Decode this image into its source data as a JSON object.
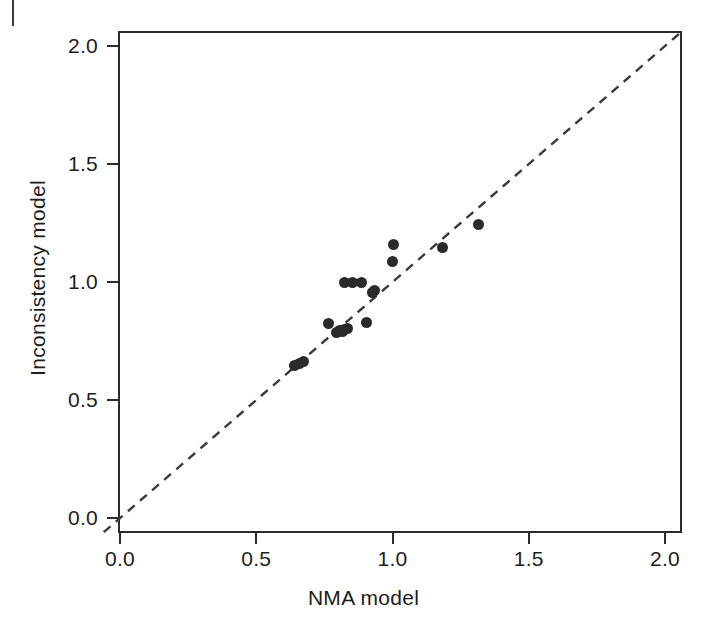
{
  "figure": {
    "background": "#ffffff",
    "marker_color": "#2a2a2a",
    "axis_color": "#2b2b2b",
    "reference_line_color": "#3a3a3a"
  },
  "chart_data": {
    "type": "scatter",
    "title": "",
    "xlabel": "NMA model",
    "ylabel": "Inconsistency model",
    "xlim": [
      -0.06,
      2.07
    ],
    "ylim": [
      -0.07,
      2.1
    ],
    "xticks": [
      "0.0",
      "0.5",
      "1.0",
      "1.5",
      "2.0"
    ],
    "xtick_values": [
      0.0,
      0.5,
      1.0,
      1.5,
      2.0
    ],
    "yticks": [
      "0.0",
      "0.5",
      "1.0",
      "1.5",
      "2.0"
    ],
    "ytick_values": [
      0.0,
      0.5,
      1.0,
      1.5,
      2.0
    ],
    "grid": false,
    "legend": "none",
    "annotations": [],
    "reference_line": {
      "label": "line of equality (y = x)",
      "style": "dashed",
      "slope": 1.0,
      "intercept": 0.0,
      "x_start": -0.06,
      "x_end": 2.07
    },
    "series": [
      {
        "name": "Treatment effect estimates",
        "marker": "filled-circle",
        "points": [
          {
            "x": 0.64,
            "y": 0.645
          },
          {
            "x": 0.66,
            "y": 0.655
          },
          {
            "x": 0.675,
            "y": 0.665
          },
          {
            "x": 0.765,
            "y": 0.825
          },
          {
            "x": 0.795,
            "y": 0.785
          },
          {
            "x": 0.805,
            "y": 0.795
          },
          {
            "x": 0.815,
            "y": 0.79
          },
          {
            "x": 0.825,
            "y": 0.8
          },
          {
            "x": 0.835,
            "y": 0.805
          },
          {
            "x": 0.825,
            "y": 1.0
          },
          {
            "x": 0.855,
            "y": 1.0
          },
          {
            "x": 0.885,
            "y": 1.0
          },
          {
            "x": 0.905,
            "y": 0.83
          },
          {
            "x": 0.925,
            "y": 0.955
          },
          {
            "x": 0.935,
            "y": 0.965
          },
          {
            "x": 1.0,
            "y": 1.085
          },
          {
            "x": 1.005,
            "y": 1.16
          },
          {
            "x": 1.185,
            "y": 1.145
          },
          {
            "x": 1.315,
            "y": 1.245
          }
        ]
      }
    ]
  }
}
